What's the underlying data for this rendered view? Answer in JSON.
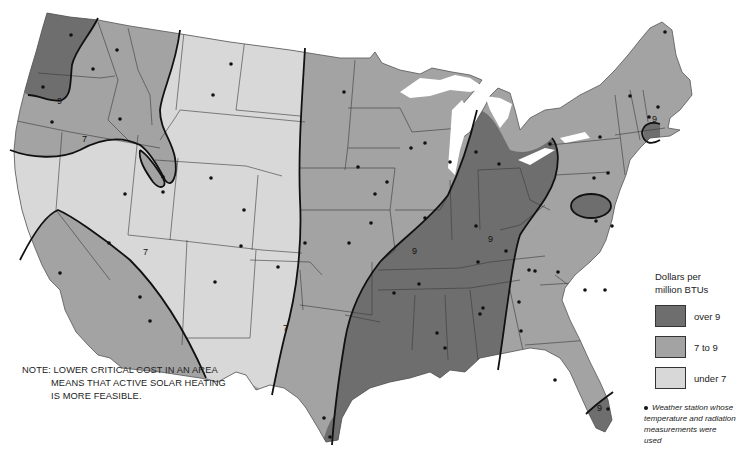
{
  "map": {
    "title": "Critical cost of solar heating across the contiguous United States",
    "colors": {
      "over_9": "#6e6e6e",
      "7_to_9": "#a3a3a3",
      "under_7": "#d8d8d8",
      "state_border": "#3a3a3a",
      "contour": "#111111",
      "water": "#ffffff"
    },
    "contour_labels": [
      {
        "text": "9",
        "x": 57,
        "y": 104
      },
      {
        "text": "7",
        "x": 82,
        "y": 142
      },
      {
        "text": "7",
        "x": 143,
        "y": 255
      },
      {
        "text": "7",
        "x": 283,
        "y": 331
      },
      {
        "text": "9",
        "x": 412,
        "y": 254
      },
      {
        "text": "9",
        "x": 488,
        "y": 242
      },
      {
        "text": "9",
        "x": 652,
        "y": 122
      },
      {
        "text": "9",
        "x": 597,
        "y": 411
      }
    ],
    "stations": [
      [
        71,
        35
      ],
      [
        117,
        50
      ],
      [
        93,
        69
      ],
      [
        43,
        87
      ],
      [
        52,
        122
      ],
      [
        120,
        119
      ],
      [
        163,
        177
      ],
      [
        231,
        64
      ],
      [
        213,
        95
      ],
      [
        125,
        194
      ],
      [
        163,
        192
      ],
      [
        211,
        178
      ],
      [
        244,
        210
      ],
      [
        109,
        243
      ],
      [
        60,
        273
      ],
      [
        140,
        297
      ],
      [
        150,
        321
      ],
      [
        215,
        282
      ],
      [
        278,
        267
      ],
      [
        305,
        243
      ],
      [
        241,
        246
      ],
      [
        344,
        92
      ],
      [
        358,
        167
      ],
      [
        375,
        194
      ],
      [
        387,
        182
      ],
      [
        371,
        223
      ],
      [
        349,
        243
      ],
      [
        425,
        143
      ],
      [
        425,
        218
      ],
      [
        411,
        148
      ],
      [
        419,
        284
      ],
      [
        478,
        262
      ],
      [
        506,
        251
      ],
      [
        476,
        226
      ],
      [
        450,
        162
      ],
      [
        476,
        152
      ],
      [
        499,
        164
      ],
      [
        550,
        144
      ],
      [
        600,
        137
      ],
      [
        594,
        178
      ],
      [
        608,
        173
      ],
      [
        596,
        221
      ],
      [
        612,
        226
      ],
      [
        630,
        96
      ],
      [
        665,
        32
      ],
      [
        658,
        107
      ],
      [
        649,
        117
      ],
      [
        535,
        271
      ],
      [
        558,
        272
      ],
      [
        519,
        302
      ],
      [
        521,
        331
      ],
      [
        437,
        333
      ],
      [
        445,
        348
      ],
      [
        324,
        418
      ],
      [
        608,
        409
      ],
      [
        330,
        437
      ],
      [
        394,
        293
      ],
      [
        483,
        308
      ],
      [
        480,
        314
      ],
      [
        555,
        380
      ],
      [
        605,
        290
      ],
      [
        529,
        270
      ],
      [
        585,
        290
      ]
    ]
  },
  "legend": {
    "title_line1": "Dollars per",
    "title_line2": "million BTUs",
    "items": [
      {
        "label": "over 9",
        "color": "#6e6e6e"
      },
      {
        "label": "7 to 9",
        "color": "#a3a3a3"
      },
      {
        "label": "under 7",
        "color": "#d8d8d8"
      }
    ],
    "station_note": "Weather station whose temperature and radiation measurements were used"
  },
  "note": {
    "line1": "NOTE: LOWER CRITICAL COST IN AN AREA",
    "line2": "MEANS THAT ACTIVE SOLAR HEATING",
    "line3": "IS MORE FEASIBLE."
  }
}
